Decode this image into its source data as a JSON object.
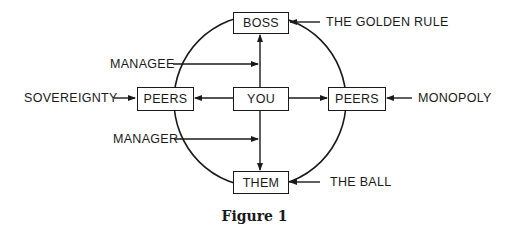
{
  "nodes": {
    "boss": "BOSS",
    "you": "YOU",
    "peers_left": "PEERS",
    "peers_right": "PEERS",
    "them": "THEM"
  },
  "labels": {
    "golden_rule": "THE GOLDEN RULE",
    "managee": "MANAGEE",
    "sovereignty": "SOVEREIGNTY",
    "monopoly": "MONOPOLY",
    "manager": "MANAGER",
    "the_ball": "THE BALL"
  },
  "caption": "Figure 1",
  "colors": {
    "ink": "#1a1a1a",
    "background": "#ffffff"
  }
}
